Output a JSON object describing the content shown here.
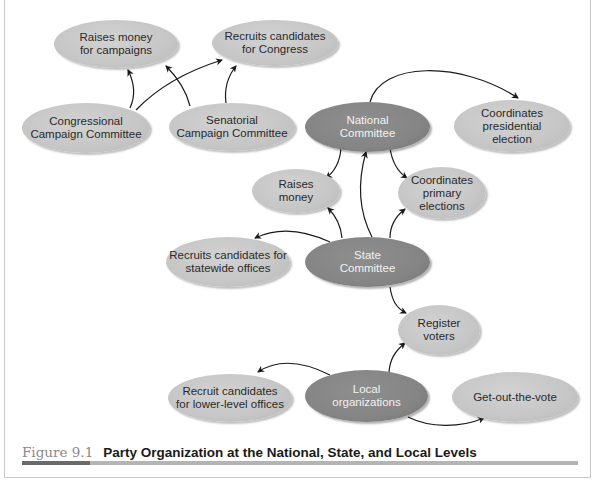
{
  "figure": {
    "number": "Figure 9.1",
    "title": "Party Organization at the National, State, and Local Levels",
    "colors": {
      "core_node": "#858585",
      "leaf_node": "#c8c8c8",
      "arrow": "#1a1a1a",
      "caption_bar_dark": "#6a6a6a",
      "caption_bar_light": "#b4b4b4"
    }
  },
  "nodes": {
    "raises_money_campaigns": {
      "label": "Raises money\nfor campaigns",
      "type": "leaf"
    },
    "recruits_congress": {
      "label": "Recruits candidates\nfor Congress",
      "type": "leaf"
    },
    "congressional_committee": {
      "label": "Congressional\nCampaign Committee",
      "type": "leaf"
    },
    "senatorial_committee": {
      "label": "Senatorial\nCampaign Committee",
      "type": "leaf"
    },
    "national_committee": {
      "label": "National\nCommittee",
      "type": "core"
    },
    "coordinates_presidential": {
      "label": "Coordinates\npresidential\nelection",
      "type": "leaf"
    },
    "raises_money": {
      "label": "Raises\nmoney",
      "type": "leaf"
    },
    "coordinates_primary": {
      "label": "Coordinates\nprimary\nelections",
      "type": "leaf"
    },
    "recruits_statewide": {
      "label": "Recruits candidates for\nstatewide offices",
      "type": "leaf"
    },
    "state_committee": {
      "label": "State\nCommittee",
      "type": "core"
    },
    "register_voters": {
      "label": "Register\nvoters",
      "type": "leaf"
    },
    "recruit_lower_level": {
      "label": "Recruit candidates\nfor lower-level offices",
      "type": "leaf"
    },
    "local_organizations": {
      "label": "Local\norganizations",
      "type": "core"
    },
    "get_out_the_vote": {
      "label": "Get-out-the-vote",
      "type": "leaf"
    }
  },
  "edges": [
    {
      "from": "congressional_committee",
      "to": "raises_money_campaigns"
    },
    {
      "from": "congressional_committee",
      "to": "recruits_congress"
    },
    {
      "from": "senatorial_committee",
      "to": "raises_money_campaigns"
    },
    {
      "from": "senatorial_committee",
      "to": "recruits_congress"
    },
    {
      "from": "national_committee",
      "to": "coordinates_presidential"
    },
    {
      "from": "national_committee",
      "to": "raises_money"
    },
    {
      "from": "national_committee",
      "to": "coordinates_primary"
    },
    {
      "from": "state_committee",
      "to": "national_committee"
    },
    {
      "from": "state_committee",
      "to": "raises_money"
    },
    {
      "from": "state_committee",
      "to": "coordinates_primary"
    },
    {
      "from": "state_committee",
      "to": "recruits_statewide"
    },
    {
      "from": "state_committee",
      "to": "register_voters"
    },
    {
      "from": "local_organizations",
      "to": "register_voters"
    },
    {
      "from": "local_organizations",
      "to": "recruit_lower_level"
    },
    {
      "from": "local_organizations",
      "to": "get_out_the_vote"
    }
  ]
}
